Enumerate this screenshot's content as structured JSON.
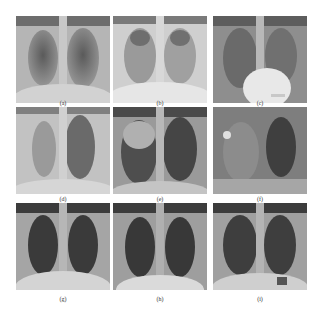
{
  "figure": {
    "panels": [
      {
        "id": "a",
        "label": "(a)",
        "description": "chest x-ray, bilateral diffuse opacities"
      },
      {
        "id": "b",
        "label": "(b)",
        "description": "chest x-ray, dense bilateral opacities"
      },
      {
        "id": "c",
        "label": "(c)",
        "description": "chest x-ray, bilateral opacities, enlarged cardiac silhouette"
      },
      {
        "id": "d",
        "label": "(d)",
        "description": "chest x-ray, right lung opacity"
      },
      {
        "id": "e",
        "label": "(e)",
        "description": "chest x-ray, right upper lobe consolidation"
      },
      {
        "id": "f",
        "label": "(f)",
        "description": "chest x-ray, right hemithorax opacity with bright nodule"
      },
      {
        "id": "g",
        "label": "(g)",
        "description": "chest x-ray, normal"
      },
      {
        "id": "h",
        "label": "(h)",
        "description": "chest x-ray, normal"
      },
      {
        "id": "i",
        "label": "(i)",
        "description": "chest x-ray, normal"
      }
    ]
  }
}
